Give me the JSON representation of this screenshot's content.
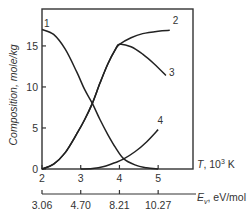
{
  "chart_data": {
    "type": "line",
    "title": "",
    "xlabel": "T, 10^3 K",
    "xlabel_parts": {
      "var": "T",
      "unit_prefix": ", 10",
      "sup": "3",
      "unit": " K"
    },
    "ylabel": "Composition, mole/kg",
    "secondary_xlabel": "E_v, eV/mol",
    "secondary_xlabel_parts": {
      "var": "E",
      "sub": "v",
      "unit": ", eV/mol"
    },
    "xlim": [
      2,
      5.9
    ],
    "ylim": [
      0,
      19.5
    ],
    "x_ticks": [
      "2",
      "3",
      "4",
      "5"
    ],
    "y_ticks": [
      "0",
      "5",
      "10",
      "15"
    ],
    "secondary_x_ticks": [
      "3.06",
      "4.70",
      "8.21",
      "10.27"
    ],
    "grid": false,
    "legend": "inline curve numbers",
    "series": [
      {
        "name": "1",
        "x": [
          2.0,
          2.3,
          2.6,
          2.9,
          3.1,
          3.3,
          3.5,
          3.7,
          3.9,
          4.1,
          4.4,
          4.7,
          5.0
        ],
        "y": [
          17.0,
          16.4,
          14.6,
          11.8,
          9.7,
          8.0,
          6.0,
          4.2,
          2.6,
          1.3,
          0.5,
          0.15,
          0.0
        ]
      },
      {
        "name": "2",
        "x": [
          2.0,
          2.3,
          2.6,
          2.9,
          3.1,
          3.3,
          3.5,
          3.7,
          3.9,
          4.0,
          4.3,
          4.6,
          5.0,
          5.3
        ],
        "y": [
          0.0,
          0.6,
          2.0,
          4.3,
          6.0,
          8.0,
          10.5,
          12.8,
          14.6,
          15.2,
          16.0,
          16.5,
          16.8,
          16.9
        ]
      },
      {
        "name": "3",
        "x": [
          2.0,
          2.3,
          2.6,
          2.9,
          3.1,
          3.3,
          3.5,
          3.7,
          3.9,
          4.0,
          4.3,
          4.6,
          4.9,
          5.2
        ],
        "y": [
          0.0,
          0.6,
          2.0,
          4.3,
          6.0,
          8.0,
          10.5,
          12.8,
          14.6,
          15.2,
          14.9,
          14.0,
          12.8,
          11.4
        ]
      },
      {
        "name": "4",
        "x": [
          3.0,
          3.3,
          3.6,
          3.9,
          4.1,
          4.4,
          4.7,
          5.0
        ],
        "y": [
          0.0,
          0.05,
          0.3,
          0.8,
          1.2,
          2.1,
          3.3,
          4.8
        ]
      }
    ],
    "curve_labels": [
      {
        "text": "1",
        "x": 2.05,
        "y": 17.3
      },
      {
        "text": "2",
        "x": 5.38,
        "y": 17.7
      },
      {
        "text": "3",
        "x": 5.28,
        "y": 11.3
      },
      {
        "text": "4",
        "x": 4.98,
        "y": 5.5
      }
    ]
  },
  "colors": {
    "line": "#222222",
    "axis": "#333333",
    "text": "#333333"
  }
}
